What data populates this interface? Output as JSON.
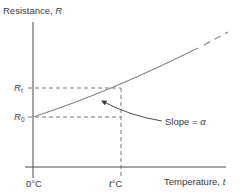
{
  "diagram": {
    "y_axis_label": "Resistance, ",
    "y_axis_symbol": "R",
    "x_axis_label": "Temperature, ",
    "x_axis_symbol": "t",
    "r_t_symbol": "R",
    "r_t_sub": "t",
    "r_0_symbol": "R",
    "r_0_sub": "0",
    "x_origin_label": "0°C",
    "x_t_symbol": "t",
    "x_t_unit": "°C",
    "slope_text": "Slope = ",
    "slope_symbol": "α",
    "colors": {
      "axis": "#4a4a4a",
      "curve": "#8a8a8a",
      "dashed": "#6a6a6a",
      "text": "#3a3a3a"
    }
  }
}
